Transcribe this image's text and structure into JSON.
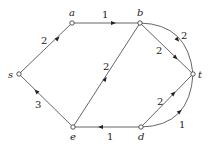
{
  "diagram": {
    "type": "directed weighted graph",
    "nodes": [
      {
        "id": "s",
        "label": "s",
        "x": 19,
        "y": 74,
        "label_dx": -11,
        "label_dy": 4
      },
      {
        "id": "a",
        "label": "a",
        "x": 72,
        "y": 23,
        "label_dx": -3,
        "label_dy": -6
      },
      {
        "id": "b",
        "label": "b",
        "x": 140,
        "y": 23,
        "label_dx": -3,
        "label_dy": -6
      },
      {
        "id": "t",
        "label": "t",
        "x": 193,
        "y": 74,
        "label_dx": 5,
        "label_dy": 4
      },
      {
        "id": "d",
        "label": "d",
        "x": 141,
        "y": 127,
        "label_dx": -3,
        "label_dy": 13
      },
      {
        "id": "e",
        "label": "e",
        "x": 73,
        "y": 127,
        "label_dx": -3,
        "label_dy": 13
      }
    ],
    "edges": [
      {
        "from": "s",
        "to": "a",
        "weight": "2",
        "shape": "straight"
      },
      {
        "from": "a",
        "to": "b",
        "weight": "1",
        "shape": "straight"
      },
      {
        "from": "b",
        "to": "t",
        "weight": "2",
        "shape": "straight"
      },
      {
        "from": "b",
        "to": "t",
        "weight": "2",
        "shape": "curved-upper"
      },
      {
        "from": "e",
        "to": "b",
        "weight": "2",
        "shape": "straight"
      },
      {
        "from": "e",
        "to": "s",
        "weight": "3",
        "shape": "straight"
      },
      {
        "from": "d",
        "to": "e",
        "weight": "1",
        "shape": "straight"
      },
      {
        "from": "d",
        "to": "t",
        "weight": "2",
        "shape": "straight"
      },
      {
        "from": "d",
        "to": "t",
        "weight": "1",
        "shape": "curved-lower"
      }
    ]
  },
  "labels": {
    "s": "s",
    "a": "a",
    "b": "b",
    "t": "t",
    "d": "d",
    "e": "e",
    "w_sa": "2",
    "w_ab": "1",
    "w_bt_straight": "2",
    "w_bt_curve": "2",
    "w_eb": "2",
    "w_es": "3",
    "w_de": "1",
    "w_dt_straight": "2",
    "w_dt_curve": "1"
  }
}
